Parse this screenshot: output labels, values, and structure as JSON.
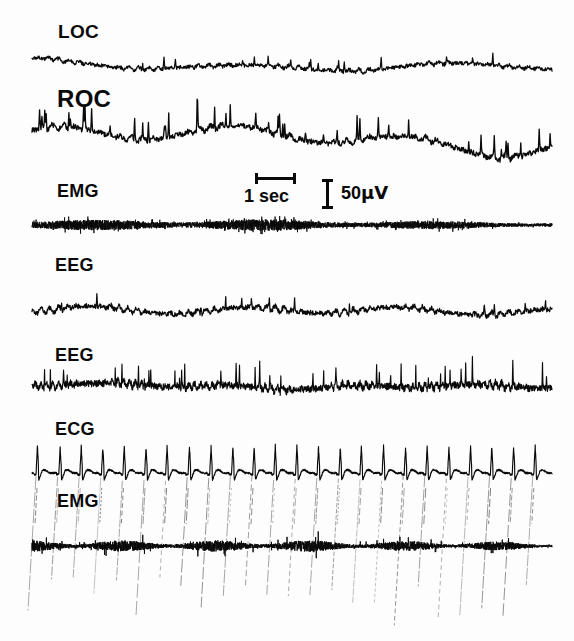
{
  "figure": {
    "kind": "polysomnogram",
    "width": 574,
    "height": 641,
    "background_color": "#fdfdfd",
    "trace_color": "#0a0a0a",
    "label_color": "#0a0a0a"
  },
  "labels": {
    "loc": "LOC",
    "roc": "ROC",
    "emg_top": "EMG",
    "eeg_1": "EEG",
    "eeg_2": "EEG",
    "ecg": "ECG",
    "emg_bottom": "EMG"
  },
  "scale_bars": {
    "time": {
      "label": "1 sec",
      "value": 1,
      "unit": "sec",
      "x": 255,
      "y": 177,
      "length": 41,
      "orientation": "horizontal"
    },
    "amplitude": {
      "label_number": "50",
      "label_unit": "µV",
      "value": 50,
      "unit": "µV",
      "x": 326,
      "y": 179,
      "length": 30,
      "orientation": "vertical"
    }
  },
  "chart_data": {
    "type": "line",
    "title": "",
    "xlabel": "",
    "ylabel": "",
    "grid": false,
    "legend": "none",
    "x_scale_note": "1 sec = 41 px",
    "y_scale_note": "50 µV = 30 px",
    "x_start_px": 32,
    "x_end_px": 552,
    "series": [
      {
        "name": "LOC",
        "label": "LOC",
        "label_x": 58,
        "label_y": 22,
        "label_size": 19,
        "baseline_y": 66,
        "amplitude": 9,
        "line_width": 1.25,
        "style": "eog-slow",
        "seed": 101,
        "params": {
          "slow_amp": 5.5,
          "slow_freq": 2.4,
          "fast_amp": 4.0,
          "fast_freq": 52,
          "noise": 1.9,
          "spike_rate": 0.016,
          "spike_amp": 9,
          "spike_dir": -1,
          "samples": 1100
        }
      },
      {
        "name": "ROC",
        "label": "ROC",
        "label_x": 57,
        "label_y": 87,
        "label_size": 24,
        "baseline_y": 143,
        "amplitude": 24,
        "line_width": 1.35,
        "style": "eog-slow",
        "seed": 207,
        "params": {
          "slow_amp": 15,
          "slow_freq": 2.9,
          "fast_amp": 6.0,
          "fast_freq": 46,
          "noise": 2.6,
          "spike_rate": 0.04,
          "spike_amp": 18,
          "spike_dir": -1,
          "samples": 1100
        }
      },
      {
        "name": "EMG-top",
        "label": "EMG",
        "label_x": 57,
        "label_y": 182,
        "label_size": 18,
        "baseline_y": 225,
        "amplitude": 14,
        "line_width": 0.85,
        "style": "emg-dense",
        "seed": 311,
        "params": {
          "noise": 7.5,
          "envelope_freq": 3.0,
          "envelope_depth": 0.45,
          "decay": 0.45,
          "samples": 4200
        }
      },
      {
        "name": "EEG-1",
        "label": "EEG",
        "label_x": 55,
        "label_y": 256,
        "label_size": 18,
        "baseline_y": 312,
        "amplitude": 14,
        "line_width": 1.25,
        "style": "eeg",
        "seed": 419,
        "params": {
          "slow_amp": 6.0,
          "slow_freq": 3.4,
          "fast_amp": 6.5,
          "fast_freq": 60,
          "noise": 2.4,
          "spike_rate": 0.01,
          "spike_amp": 9,
          "spike_dir": -1,
          "samples": 1300
        }
      },
      {
        "name": "EEG-2",
        "label": "EEG",
        "label_x": 55,
        "label_y": 346,
        "label_size": 18,
        "baseline_y": 388,
        "amplitude": 17,
        "line_width": 1.15,
        "style": "eeg",
        "seed": 523,
        "params": {
          "slow_amp": 3.2,
          "slow_freq": 4.2,
          "fast_amp": 7.5,
          "fast_freq": 88,
          "noise": 3.4,
          "spike_rate": 0.03,
          "spike_amp": 20,
          "spike_dir": -1,
          "samples": 1700
        }
      },
      {
        "name": "ECG",
        "label": "ECG",
        "label_x": 55,
        "label_y": 420,
        "label_size": 18,
        "baseline_y": 473,
        "amplitude": 26,
        "line_width": 1.15,
        "style": "ecg",
        "seed": 631,
        "beats": 24,
        "params": {
          "rr_px": 21.6,
          "r_amp": 26,
          "q_amp": 3,
          "s_amp": 7,
          "t_amp": 3,
          "jitter": 0.7,
          "samples": 2600
        }
      },
      {
        "name": "EMG-bottom",
        "label": "EMG",
        "label_x": 57,
        "label_y": 492,
        "label_size": 18,
        "baseline_y": 546,
        "amplitude": 18,
        "line_width": 0.95,
        "style": "emg-burst",
        "seed": 743,
        "params": {
          "noise": 8.0,
          "envelope_freq": 5.5,
          "envelope_depth": 0.62,
          "burst_amp": 15,
          "samples": 3400
        }
      }
    ],
    "artifact_streaks": {
      "name": "ecg-crosstalk-streaks",
      "description": "faint diagonal ECG crosstalk lines descending through ECG and lower EMG channels",
      "count": 24,
      "top_y": 478,
      "bottom_y": 630,
      "slant": -9,
      "opacity": 0.55,
      "width": 0.8,
      "spacing": 21.6,
      "x_start": 36
    }
  }
}
